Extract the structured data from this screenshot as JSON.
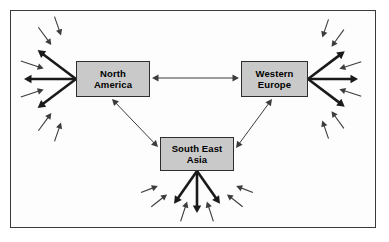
{
  "figure": {
    "type": "diagram",
    "kind": "radial-flow-network",
    "frame": {
      "border_color": "#3a3a3a",
      "background": "#fdfdfd"
    },
    "background": "#ffffff"
  },
  "nodes": [
    {
      "id": "north-america",
      "label": "North\nAmerica",
      "line1": "North",
      "line2": "America",
      "fill": "#c9c9c9",
      "stroke": "#2e2e2e",
      "x": 76,
      "y": 61,
      "w": 74,
      "h": 36
    },
    {
      "id": "western-europe",
      "label": "Western\nEurope",
      "line1": "Western",
      "line2": "Europe",
      "fill": "#c9c9c9",
      "stroke": "#2e2e2e",
      "x": 241,
      "y": 61,
      "w": 67,
      "h": 36
    },
    {
      "id": "south-east-asia",
      "label": "South East\nAsia",
      "line1": "South East",
      "line2": "Asia",
      "fill": "#c9c9c9",
      "stroke": "#2e2e2e",
      "x": 160,
      "y": 137,
      "w": 74,
      "h": 34
    }
  ],
  "connectors": [
    {
      "id": "na-we",
      "from": "north-america",
      "to": "western-europe",
      "style": "thin-double-headed",
      "x1": 152,
      "y1": 78,
      "x2": 239,
      "y2": 78
    },
    {
      "id": "na-sea",
      "from": "north-america",
      "to": "south-east-asia",
      "style": "thin-double-headed",
      "x1": 112,
      "y1": 99,
      "x2": 158,
      "y2": 147
    },
    {
      "id": "we-sea",
      "from": "western-europe",
      "to": "south-east-asia",
      "style": "thin-double-headed",
      "x1": 272,
      "y1": 99,
      "x2": 236,
      "y2": 148
    }
  ],
  "fans": [
    {
      "id": "fan-north-america",
      "source": "north-america",
      "direction": "left",
      "origin_x": 76,
      "origin_y": 79,
      "thick_arrows": [
        {
          "angle_deg": 180,
          "length": 52
        },
        {
          "angle_deg": 217,
          "length": 48
        },
        {
          "angle_deg": 143,
          "length": 48
        }
      ],
      "thin_arrows": [
        {
          "angle_deg": 198,
          "start": 34,
          "length": 24
        },
        {
          "angle_deg": 162,
          "start": 34,
          "length": 24
        },
        {
          "angle_deg": 234,
          "start": 42,
          "length": 22
        },
        {
          "angle_deg": 126,
          "start": 42,
          "length": 22
        },
        {
          "angle_deg": 251,
          "start": 46,
          "length": 20
        },
        {
          "angle_deg": 109,
          "start": 46,
          "length": 20
        }
      ]
    },
    {
      "id": "fan-western-europe",
      "source": "western-europe",
      "direction": "right",
      "origin_x": 308,
      "origin_y": 79,
      "thick_arrows": [
        {
          "angle_deg": 0,
          "length": 50
        },
        {
          "angle_deg": 37,
          "length": 46
        },
        {
          "angle_deg": -37,
          "length": 46
        }
      ],
      "thin_arrows": [
        {
          "angle_deg": 18,
          "start": 33,
          "length": 23
        },
        {
          "angle_deg": -18,
          "start": 33,
          "length": 23
        },
        {
          "angle_deg": 54,
          "start": 40,
          "length": 21
        },
        {
          "angle_deg": -54,
          "start": 40,
          "length": 21
        },
        {
          "angle_deg": 71,
          "start": 44,
          "length": 19
        },
        {
          "angle_deg": -71,
          "start": 44,
          "length": 19
        }
      ]
    },
    {
      "id": "fan-south-east-asia",
      "source": "south-east-asia",
      "direction": "down",
      "origin_x": 197,
      "origin_y": 171,
      "thick_arrows": [
        {
          "angle_deg": 90,
          "length": 42
        },
        {
          "angle_deg": 55,
          "length": 40
        },
        {
          "angle_deg": 125,
          "length": 40
        }
      ],
      "thin_arrows": [
        {
          "angle_deg": 72,
          "start": 32,
          "length": 21
        },
        {
          "angle_deg": 108,
          "start": 32,
          "length": 21
        },
        {
          "angle_deg": 38,
          "start": 38,
          "length": 20
        },
        {
          "angle_deg": 142,
          "start": 38,
          "length": 20
        },
        {
          "angle_deg": 21,
          "start": 42,
          "length": 18
        },
        {
          "angle_deg": 159,
          "start": 42,
          "length": 18
        }
      ]
    }
  ],
  "style": {
    "thick_arrow_color": "#1a1a1a",
    "thick_arrow_width": 2.6,
    "thin_arrow_color": "#3c3c3c",
    "thin_arrow_width": 1.1,
    "connector_color": "#3c3c3c",
    "connector_width": 1.0
  }
}
